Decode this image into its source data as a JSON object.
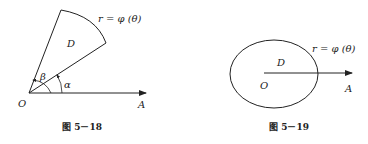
{
  "figures": [
    {
      "id": "fig-5-18",
      "caption": "图 5－18",
      "labels": {
        "curve": "r = φ (θ)",
        "region": "D",
        "origin": "O",
        "axis": "A",
        "angle_alpha": "α",
        "angle_beta": "β"
      }
    },
    {
      "id": "fig-5-19",
      "caption": "图 5－19",
      "labels": {
        "curve": "r = φ (θ)",
        "region": "D",
        "origin": "O",
        "axis": "A"
      }
    }
  ]
}
